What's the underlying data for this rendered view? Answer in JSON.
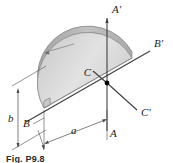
{
  "figure": {
    "caption": "Fig. P9.8",
    "axes": [
      {
        "id": "A-prime",
        "label": "A'",
        "x": 112,
        "y": 13
      },
      {
        "id": "B-prime",
        "label": "B'",
        "x": 154,
        "y": 47
      },
      {
        "id": "C-prime",
        "label": "C'",
        "x": 141,
        "y": 116
      },
      {
        "id": "A",
        "label": "A",
        "x": 110,
        "y": 137
      },
      {
        "id": "B",
        "label": "B",
        "x": 25,
        "y": 126
      },
      {
        "id": "C",
        "label": "C",
        "x": 91,
        "y": 76
      }
    ],
    "dimensions": [
      {
        "id": "b",
        "label": "b",
        "x": 9,
        "y": 118
      },
      {
        "id": "a",
        "label": "a",
        "x": 72,
        "y": 130
      }
    ],
    "colors": {
      "body_fill_light": "#e3e3e3",
      "body_fill_mid": "#cccccc",
      "body_fill_dark": "#b4b4b4",
      "outline": "#8a8a8a",
      "axis_line": "#3a3a3a",
      "dim_line": "#4a4a4a",
      "center_point": "#000000",
      "background": "#ffffff"
    },
    "shape_name": "semicircular-plate"
  }
}
